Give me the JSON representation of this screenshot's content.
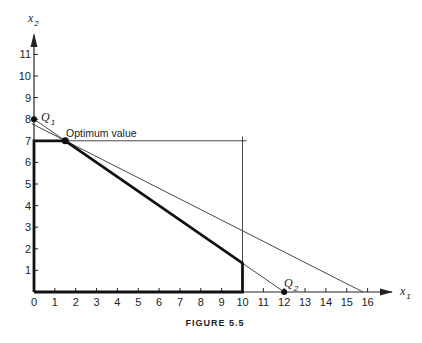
{
  "chart_data": {
    "type": "line",
    "caption": "FIGURE 5.5",
    "xlabel": "x",
    "xlabel_sub": "1",
    "ylabel": "x",
    "ylabel_sub": "2",
    "xlim": [
      0,
      16
    ],
    "ylim": [
      0,
      11
    ],
    "x_ticks": [
      0,
      1,
      2,
      3,
      4,
      5,
      6,
      7,
      8,
      9,
      10,
      11,
      12,
      13,
      14,
      15,
      16
    ],
    "y_ticks": [
      1,
      2,
      3,
      4,
      5,
      6,
      7,
      8,
      9,
      10,
      11
    ],
    "grid": false,
    "feasible_region": [
      [
        0,
        0
      ],
      [
        0,
        7
      ],
      [
        1.5,
        7
      ],
      [
        10,
        1.333
      ],
      [
        10,
        0
      ],
      [
        0,
        0
      ]
    ],
    "constraint_lines": [
      {
        "name": "x2 = 7",
        "points": [
          [
            0,
            7
          ],
          [
            10.2,
            7
          ]
        ]
      },
      {
        "name": "x1 = 10",
        "points": [
          [
            10,
            0
          ],
          [
            10,
            7.2
          ]
        ]
      }
    ],
    "objective_lines": [
      {
        "name": "Q1-Q2",
        "points": [
          [
            -0.1,
            8.07
          ],
          [
            12,
            0
          ]
        ]
      },
      {
        "name": "second-line",
        "points": [
          [
            -0.1,
            7.79
          ],
          [
            15.78,
            0
          ]
        ]
      }
    ],
    "points": [
      {
        "label": "Q",
        "sub": "1",
        "x": 0,
        "y": 8
      },
      {
        "label": "Q",
        "sub": "2",
        "x": 12,
        "y": 0
      },
      {
        "label": "Optimum value",
        "sub": "",
        "x": 1.5,
        "y": 7
      }
    ]
  }
}
